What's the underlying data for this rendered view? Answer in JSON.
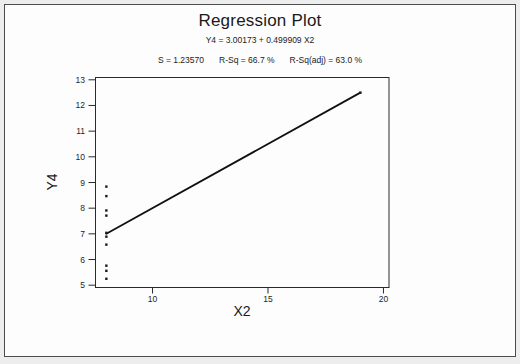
{
  "window": {
    "background": "#ededed",
    "figure_border_color": "#4d4d4d",
    "figure_background": "#fdfdfd"
  },
  "chart_data": {
    "type": "scatter",
    "title": "Regression Plot",
    "equation": "Y4 = 3.00173 + 0.499909 X2",
    "stats": {
      "s": "S = 1.23570",
      "r_sq": "R-Sq = 66.7 %",
      "r_sq_adj": "R-Sq(adj) = 63.0 %"
    },
    "xlabel": "X2",
    "ylabel": "Y4",
    "xlim": [
      7.53,
      20.24
    ],
    "ylim": [
      4.91,
      13.09
    ],
    "x_ticks": [
      10,
      15,
      20
    ],
    "y_ticks": [
      5,
      6,
      7,
      8,
      9,
      10,
      11,
      12,
      13
    ],
    "grid": false,
    "legend": "none",
    "series": [
      {
        "name": "observations",
        "points": [
          [
            8,
            6.58
          ],
          [
            8,
            5.76
          ],
          [
            8,
            7.71
          ],
          [
            8,
            8.84
          ],
          [
            8,
            8.47
          ],
          [
            8,
            7.04
          ],
          [
            8,
            5.25
          ],
          [
            19,
            12.5
          ],
          [
            8,
            5.56
          ],
          [
            8,
            7.91
          ],
          [
            8,
            6.89
          ]
        ]
      }
    ],
    "fit_line": {
      "intercept": 3.00173,
      "slope": 0.499909,
      "x_start": 8,
      "x_end": 19
    },
    "colors": {
      "marker": "#1a1a1a",
      "line": "#111111",
      "frame": "#2a2a2a",
      "tick": "#2a2a2a"
    }
  }
}
